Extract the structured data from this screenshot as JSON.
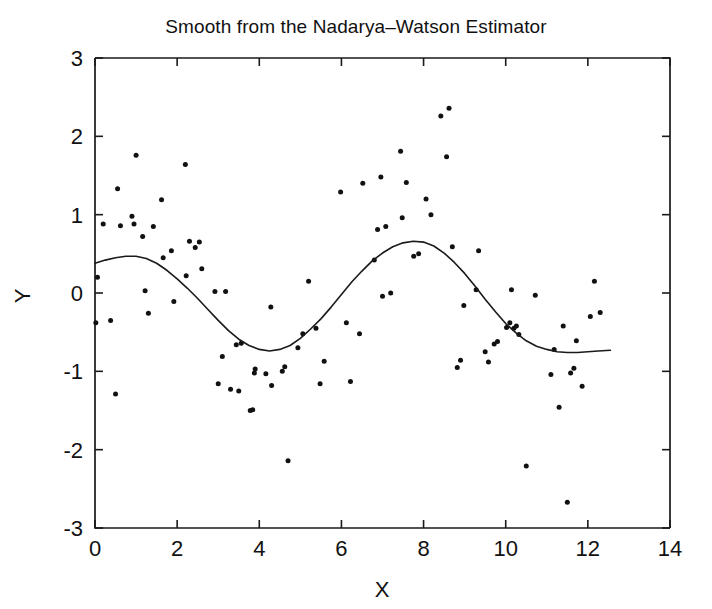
{
  "chart_data": {
    "type": "scatter",
    "title": "Smooth from the Nadarya–Watson Estimator",
    "xlabel": "X",
    "ylabel": "Y",
    "xlim": [
      0,
      14
    ],
    "ylim": [
      -3,
      3
    ],
    "xticks": [
      0,
      2,
      4,
      6,
      8,
      10,
      12,
      14
    ],
    "xtick_labels": [
      "0",
      "2",
      "4",
      "6",
      "8",
      "10",
      "12",
      "14"
    ],
    "yticks": [
      -3,
      -2,
      -1,
      0,
      1,
      2,
      3
    ],
    "ytick_labels": [
      "-3",
      "-2",
      "-1",
      "0",
      "1",
      "2",
      "3"
    ],
    "grid": false,
    "legend": null,
    "marker": {
      "shape": "circle",
      "color": "#111111",
      "size": 5
    },
    "line": {
      "name": "Nadaraya-Watson smooth",
      "color": "#1a1a1a",
      "width": 1.6
    },
    "series": [
      {
        "name": "observations",
        "type": "scatter",
        "points": [
          [
            0.02,
            -0.38
          ],
          [
            0.06,
            0.2
          ],
          [
            0.2,
            0.88
          ],
          [
            0.38,
            -0.35
          ],
          [
            0.5,
            -1.29
          ],
          [
            0.55,
            1.33
          ],
          [
            0.62,
            0.86
          ],
          [
            0.9,
            0.98
          ],
          [
            0.95,
            0.88
          ],
          [
            1.0,
            1.76
          ],
          [
            1.16,
            0.72
          ],
          [
            1.22,
            0.03
          ],
          [
            1.3,
            -0.26
          ],
          [
            1.42,
            0.85
          ],
          [
            1.62,
            1.19
          ],
          [
            1.66,
            0.45
          ],
          [
            1.86,
            0.54
          ],
          [
            1.92,
            -0.11
          ],
          [
            2.2,
            1.64
          ],
          [
            2.22,
            0.22
          ],
          [
            2.3,
            0.66
          ],
          [
            2.44,
            0.58
          ],
          [
            2.54,
            0.65
          ],
          [
            2.6,
            0.31
          ],
          [
            2.92,
            0.02
          ],
          [
            3.0,
            -1.16
          ],
          [
            3.1,
            -0.81
          ],
          [
            3.18,
            0.02
          ],
          [
            3.3,
            -1.23
          ],
          [
            3.44,
            -0.66
          ],
          [
            3.5,
            -1.25
          ],
          [
            3.56,
            -0.64
          ],
          [
            3.78,
            -1.5
          ],
          [
            3.84,
            -1.49
          ],
          [
            3.88,
            -1.02
          ],
          [
            3.9,
            -0.97
          ],
          [
            4.16,
            -1.03
          ],
          [
            4.28,
            -0.18
          ],
          [
            4.3,
            -1.18
          ],
          [
            4.56,
            -1.0
          ],
          [
            4.62,
            -0.94
          ],
          [
            4.7,
            -2.14
          ],
          [
            4.94,
            -0.7
          ],
          [
            5.06,
            -0.52
          ],
          [
            5.2,
            0.15
          ],
          [
            5.38,
            -0.45
          ],
          [
            5.48,
            -1.16
          ],
          [
            5.58,
            -0.87
          ],
          [
            5.98,
            1.29
          ],
          [
            6.12,
            -0.38
          ],
          [
            6.22,
            -1.13
          ],
          [
            6.44,
            -0.52
          ],
          [
            6.52,
            1.4
          ],
          [
            6.8,
            0.42
          ],
          [
            6.88,
            0.81
          ],
          [
            6.96,
            1.48
          ],
          [
            7.0,
            -0.04
          ],
          [
            7.08,
            0.85
          ],
          [
            7.2,
            0.0
          ],
          [
            7.44,
            1.81
          ],
          [
            7.48,
            0.96
          ],
          [
            7.58,
            1.41
          ],
          [
            7.76,
            0.47
          ],
          [
            7.88,
            0.5
          ],
          [
            8.06,
            1.2
          ],
          [
            8.18,
            1.0
          ],
          [
            8.42,
            2.26
          ],
          [
            8.56,
            1.74
          ],
          [
            8.62,
            2.36
          ],
          [
            8.7,
            0.59
          ],
          [
            8.82,
            -0.95
          ],
          [
            8.9,
            -0.86
          ],
          [
            8.98,
            -0.16
          ],
          [
            9.28,
            0.04
          ],
          [
            9.34,
            0.54
          ],
          [
            9.5,
            -0.75
          ],
          [
            9.58,
            -0.88
          ],
          [
            9.72,
            -0.65
          ],
          [
            9.8,
            -0.62
          ],
          [
            10.02,
            -0.44
          ],
          [
            10.1,
            -0.38
          ],
          [
            10.14,
            0.04
          ],
          [
            10.2,
            -0.45
          ],
          [
            10.26,
            -0.42
          ],
          [
            10.32,
            -0.53
          ],
          [
            10.5,
            -2.21
          ],
          [
            10.72,
            -0.03
          ],
          [
            11.1,
            -1.04
          ],
          [
            11.18,
            -0.72
          ],
          [
            11.3,
            -1.46
          ],
          [
            11.4,
            -0.42
          ],
          [
            11.5,
            -2.67
          ],
          [
            11.58,
            -1.02
          ],
          [
            11.66,
            -0.96
          ],
          [
            11.72,
            -0.61
          ],
          [
            11.86,
            -1.19
          ],
          [
            12.06,
            -0.3
          ],
          [
            12.16,
            0.15
          ],
          [
            12.3,
            -0.25
          ]
        ]
      },
      {
        "name": "smooth",
        "type": "line",
        "points": [
          [
            0.0,
            0.38
          ],
          [
            0.25,
            0.42
          ],
          [
            0.5,
            0.45
          ],
          [
            0.75,
            0.47
          ],
          [
            1.0,
            0.47
          ],
          [
            1.25,
            0.44
          ],
          [
            1.5,
            0.38
          ],
          [
            1.75,
            0.29
          ],
          [
            2.0,
            0.18
          ],
          [
            2.25,
            0.06
          ],
          [
            2.5,
            -0.07
          ],
          [
            2.75,
            -0.21
          ],
          [
            3.0,
            -0.35
          ],
          [
            3.25,
            -0.48
          ],
          [
            3.5,
            -0.59
          ],
          [
            3.75,
            -0.67
          ],
          [
            4.0,
            -0.72
          ],
          [
            4.25,
            -0.74
          ],
          [
            4.5,
            -0.72
          ],
          [
            4.75,
            -0.67
          ],
          [
            5.0,
            -0.58
          ],
          [
            5.25,
            -0.46
          ],
          [
            5.5,
            -0.33
          ],
          [
            5.75,
            -0.18
          ],
          [
            6.0,
            -0.02
          ],
          [
            6.25,
            0.14
          ],
          [
            6.5,
            0.28
          ],
          [
            6.75,
            0.41
          ],
          [
            7.0,
            0.51
          ],
          [
            7.25,
            0.59
          ],
          [
            7.5,
            0.64
          ],
          [
            7.75,
            0.66
          ],
          [
            8.0,
            0.65
          ],
          [
            8.25,
            0.6
          ],
          [
            8.5,
            0.51
          ],
          [
            8.75,
            0.39
          ],
          [
            9.0,
            0.25
          ],
          [
            9.25,
            0.09
          ],
          [
            9.5,
            -0.08
          ],
          [
            9.75,
            -0.24
          ],
          [
            10.0,
            -0.39
          ],
          [
            10.25,
            -0.51
          ],
          [
            10.5,
            -0.61
          ],
          [
            10.75,
            -0.68
          ],
          [
            11.0,
            -0.72
          ],
          [
            11.25,
            -0.75
          ],
          [
            11.5,
            -0.76
          ],
          [
            11.75,
            -0.76
          ],
          [
            12.0,
            -0.75
          ],
          [
            12.25,
            -0.74
          ],
          [
            12.55,
            -0.73
          ]
        ]
      }
    ]
  }
}
